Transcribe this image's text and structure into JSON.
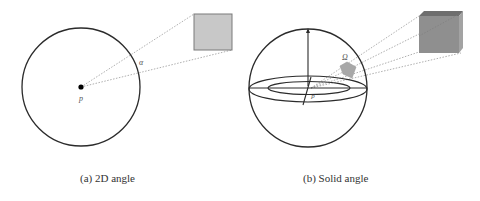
{
  "figure": {
    "panels": [
      {
        "id": "a",
        "caption": "(a) 2D angle",
        "point_label": "p",
        "angle_label": "α",
        "shape": "circle",
        "object": "square"
      },
      {
        "id": "b",
        "caption": "(b) Solid angle",
        "point_label": "p",
        "angle_label": "Ω",
        "shape": "sphere",
        "object": "cube"
      }
    ]
  },
  "colors": {
    "stroke": "#2b2b2b",
    "dotted": "#9a9a9a",
    "square_fill": "#c8c8c8",
    "square_stroke": "#7a7a7a",
    "cube_front": "#8f8f8f",
    "cube_top": "#6e6e6e",
    "cube_side": "#a3a3a3",
    "patch_fill": "#a8a8a8"
  }
}
